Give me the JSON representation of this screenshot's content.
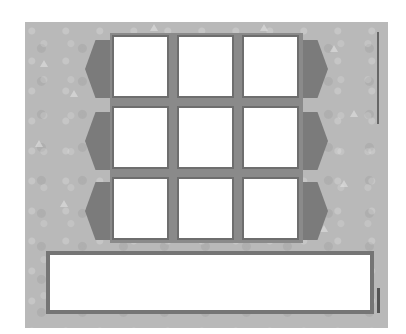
{
  "worksheet": {
    "background_color": "#b9b9b9",
    "tab_color": "#7b7b7b",
    "cell_border_color": "#6e6e6e",
    "grid": {
      "rows": 3,
      "columns": 3,
      "cells": [
        {
          "row": 1,
          "col": 1,
          "content": ""
        },
        {
          "row": 1,
          "col": 2,
          "content": ""
        },
        {
          "row": 1,
          "col": 3,
          "content": ""
        },
        {
          "row": 2,
          "col": 1,
          "content": ""
        },
        {
          "row": 2,
          "col": 2,
          "content": ""
        },
        {
          "row": 2,
          "col": 3,
          "content": ""
        },
        {
          "row": 3,
          "col": 1,
          "content": ""
        },
        {
          "row": 3,
          "col": 2,
          "content": ""
        },
        {
          "row": 3,
          "col": 3,
          "content": ""
        }
      ]
    },
    "answer_box": {
      "content": ""
    },
    "side_text_top": "",
    "side_text_bottom": ""
  }
}
